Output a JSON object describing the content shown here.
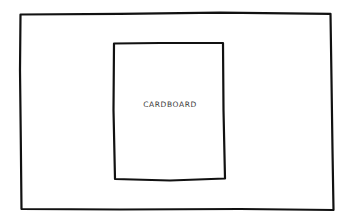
{
  "diagram": {
    "outer_frame": {
      "label": ""
    },
    "inner_panel": {
      "label": "CARDBOARD"
    }
  },
  "colors": {
    "stroke": "#111111",
    "text": "#3a3a3a",
    "background": "#ffffff"
  }
}
